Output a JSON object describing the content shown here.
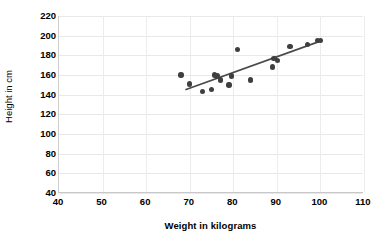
{
  "chart_data": {
    "type": "scatter",
    "title": "",
    "xlabel": "Weight in kilograms",
    "ylabel": "Height in cm",
    "xlim": [
      40,
      110
    ],
    "ylim": [
      40,
      220
    ],
    "xticks": [
      40,
      50,
      60,
      70,
      80,
      90,
      100,
      110
    ],
    "yticks": [
      40,
      60,
      80,
      100,
      120,
      140,
      160,
      180,
      200,
      220
    ],
    "grid": true,
    "legend": "none",
    "point_color": "#3f3f3f",
    "trendline_color": "#4a4a4a",
    "points": [
      {
        "x": 68.0,
        "y": 160
      },
      {
        "x": 70.0,
        "y": 151
      },
      {
        "x": 73.0,
        "y": 143
      },
      {
        "x": 75.0,
        "y": 145
      },
      {
        "x": 75.7,
        "y": 160
      },
      {
        "x": 76.3,
        "y": 159
      },
      {
        "x": 77.0,
        "y": 155
      },
      {
        "x": 79.0,
        "y": 150
      },
      {
        "x": 79.6,
        "y": 159
      },
      {
        "x": 81.0,
        "y": 186
      },
      {
        "x": 84.0,
        "y": 155
      },
      {
        "x": 89.0,
        "y": 168
      },
      {
        "x": 89.3,
        "y": 177
      },
      {
        "x": 90.2,
        "y": 175
      },
      {
        "x": 93.0,
        "y": 189
      },
      {
        "x": 97.0,
        "y": 191
      },
      {
        "x": 99.3,
        "y": 195
      },
      {
        "x": 100.0,
        "y": 195
      }
    ],
    "trendline": {
      "x_start": 69.0,
      "y_start": 145.0,
      "x_end": 100.3,
      "y_end": 195.0
    }
  }
}
